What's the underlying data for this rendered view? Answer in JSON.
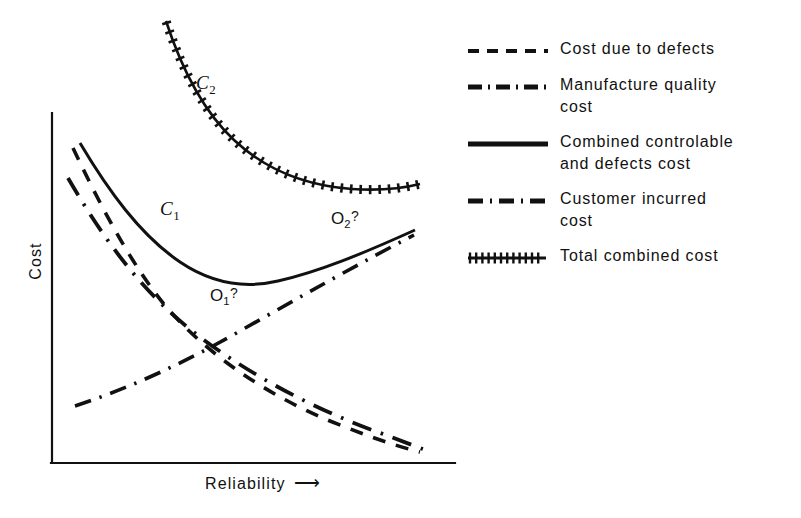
{
  "figure": {
    "background_color": "#ffffff",
    "ink_color": "#111111"
  },
  "axes": {
    "y_label": "Cost",
    "x_label": "Reliability",
    "x_label_arrow": "⟶"
  },
  "annotations": {
    "c2": {
      "base": "C",
      "sub": "2"
    },
    "c1": {
      "base": "C",
      "sub": "1"
    },
    "o1": {
      "base": "O",
      "sub": "1",
      "mark": "?"
    },
    "o2": {
      "base": "O",
      "sub": "2",
      "mark": "?"
    }
  },
  "legend": {
    "items": [
      {
        "style": "dashed",
        "label_line1": "Cost due to defects",
        "label_line2": ""
      },
      {
        "style": "dash-dot",
        "label_line1": "Manufacture quality",
        "label_line2": "cost"
      },
      {
        "style": "solid",
        "label_line1": "Combined controlable",
        "label_line2": "and  defects cost"
      },
      {
        "style": "long-dash-dot",
        "label_line1": "Customer incurred",
        "label_line2": "cost"
      },
      {
        "style": "plus-hatched",
        "label_line1": "Total combined cost",
        "label_line2": ""
      }
    ]
  },
  "chart_data": {
    "type": "line",
    "title": "",
    "xlabel": "Reliability",
    "ylabel": "Cost",
    "grid": false,
    "legend_position": "right",
    "axis_style": "schematic-no-ticks",
    "xlim": [
      0,
      100
    ],
    "ylim": [
      0,
      100
    ],
    "note": "Schematic quality-cost diagram; axes are unscaled, values are normalized 0-100 positional estimates read off the drawing.",
    "series": [
      {
        "name": "Cost due to defects",
        "style": "dashed",
        "x": [
          6,
          14,
          22,
          31,
          40,
          50,
          60,
          70,
          80,
          92
        ],
        "y": [
          83,
          70,
          58,
          46,
          36,
          27,
          20,
          15,
          11,
          7
        ]
      },
      {
        "name": "Manufacture quality cost",
        "style": "dash-dot",
        "x": [
          6,
          18,
          30,
          42,
          54,
          66,
          78,
          92
        ],
        "y": [
          17,
          23,
          29,
          36,
          43,
          51,
          60,
          69
        ]
      },
      {
        "name": "Combined controlable and defects cost",
        "style": "solid",
        "x": [
          8,
          16,
          25,
          34,
          43,
          52,
          60,
          68,
          76,
          84,
          92
        ],
        "y": [
          89,
          76,
          65,
          56,
          50,
          47,
          47,
          49,
          53,
          59,
          66
        ],
        "minimum_label": "O1?",
        "minimum_x": 55,
        "minimum_y": 47
      },
      {
        "name": "Customer incurred cost",
        "style": "long-dash-dot",
        "x": [
          6,
          15,
          25,
          35,
          45,
          55,
          65,
          76,
          90
        ],
        "y": [
          74,
          60,
          48,
          38,
          30,
          23,
          17,
          12,
          7
        ]
      },
      {
        "name": "Total combined cost",
        "style": "plus-hatched",
        "x": [
          28,
          33,
          38,
          44,
          50,
          57,
          64,
          71,
          78,
          85,
          92
        ],
        "y": [
          99,
          90,
          80,
          72,
          66,
          62,
          60,
          59,
          59,
          60,
          62
        ],
        "minimum_label": "O2?",
        "minimum_x": 74,
        "minimum_y": 59
      }
    ]
  }
}
